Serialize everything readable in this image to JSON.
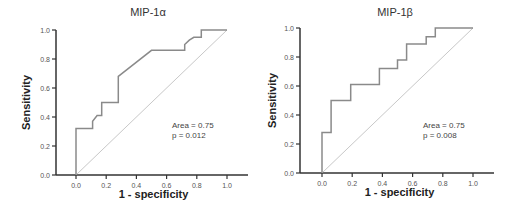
{
  "chart_data": [
    {
      "type": "line",
      "title": "MIP-1α",
      "xlabel": "1 - specificity",
      "ylabel": "Sensitivity",
      "xlim": [
        0,
        1
      ],
      "ylim": [
        0,
        1
      ],
      "xticks": [
        "0.0",
        "0.2",
        "0.4",
        "0.6",
        "0.8",
        "1.0"
      ],
      "yticks": [
        "0.0",
        "0.2",
        "0.4",
        "0.6",
        "0.8",
        "1.0"
      ],
      "grid": false,
      "series": [
        {
          "name": "ROC",
          "x": [
            0,
            0,
            0.11,
            0.11,
            0.14,
            0.17,
            0.17,
            0.28,
            0.28,
            0.5,
            0.72,
            0.72,
            0.75,
            0.78,
            0.83,
            0.83,
            1.0
          ],
          "y": [
            0,
            0.32,
            0.32,
            0.37,
            0.41,
            0.41,
            0.5,
            0.5,
            0.68,
            0.86,
            0.86,
            0.9,
            0.93,
            0.95,
            0.95,
            1.0,
            1.0
          ]
        },
        {
          "name": "Reference",
          "x": [
            0,
            1
          ],
          "y": [
            0,
            1
          ]
        }
      ],
      "annotations": [
        "Area = 0.75",
        "p = 0.012"
      ]
    },
    {
      "type": "line",
      "title": "MIP-1β",
      "xlabel": "1 - specificity",
      "ylabel": "Sensitivity",
      "xlim": [
        0,
        1
      ],
      "ylim": [
        0,
        1
      ],
      "xticks": [
        "0.0",
        "0.2",
        "0.4",
        "0.6",
        "0.8",
        "1.0"
      ],
      "yticks": [
        "0.0",
        "0.2",
        "0.4",
        "0.6",
        "0.8",
        "1.0"
      ],
      "grid": false,
      "series": [
        {
          "name": "ROC",
          "x": [
            0,
            0,
            0.06,
            0.06,
            0.19,
            0.19,
            0.38,
            0.38,
            0.5,
            0.5,
            0.56,
            0.56,
            0.69,
            0.69,
            0.75,
            0.75,
            1.0
          ],
          "y": [
            0,
            0.28,
            0.28,
            0.5,
            0.5,
            0.61,
            0.61,
            0.72,
            0.72,
            0.78,
            0.78,
            0.89,
            0.89,
            0.94,
            0.94,
            1.0,
            1.0
          ]
        },
        {
          "name": "Reference",
          "x": [
            0,
            1
          ],
          "y": [
            0,
            1
          ]
        }
      ],
      "annotations": [
        "Area = 0.75",
        "p = 0.008"
      ]
    }
  ],
  "charts": {
    "left": {
      "title": "MIP-1α",
      "xlabel": "1 - specificity",
      "ylabel": "Sensitivity",
      "area": "Area = 0.75",
      "p": "p = 0.012"
    },
    "right": {
      "title": "MIP-1β",
      "xlabel": "1 - specificity",
      "ylabel": "Sensitivity",
      "area": "Area = 0.75",
      "p": "p = 0.008"
    }
  },
  "colors": {
    "curve": "#8a8a8a",
    "reference": "#c8c8c8",
    "axis": "#333333"
  }
}
